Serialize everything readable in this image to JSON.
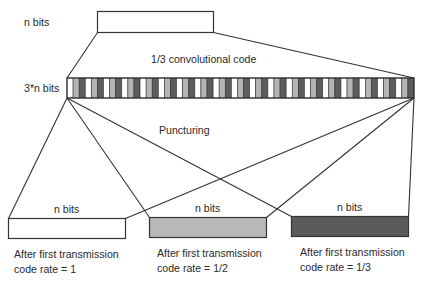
{
  "diagram": {
    "input_label": "n bits",
    "encoder_label": "1/3 convolutional code",
    "encoded_label": "3*n bits",
    "puncturing_label": "Puncturing",
    "encoded_pattern_colors": [
      "#ffffff",
      "#b4b4b4",
      "#5c5c5c"
    ],
    "encoded_cell_count": 57,
    "outputs": [
      {
        "label": "n bits",
        "caption_line1": "After first transmission",
        "caption_line2": "code rate = 1",
        "fill": "#ffffff"
      },
      {
        "label": "n bits",
        "caption_line1": "After first transmission",
        "caption_line2": "code rate = 1/2",
        "fill": "#b8b8b8"
      },
      {
        "label": "n bits",
        "caption_line1": "After first transmission",
        "caption_line2": "code rate = 1/3",
        "fill": "#5a5a5a"
      }
    ]
  }
}
